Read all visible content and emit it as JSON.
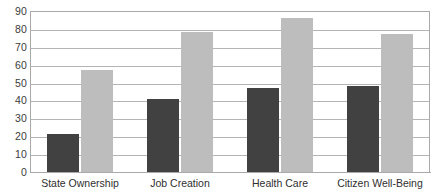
{
  "chart_data": {
    "type": "bar",
    "title": "",
    "subtitle": "",
    "xlabel": "",
    "ylabel": "",
    "ylim": [
      0,
      90
    ],
    "ytick_step": 10,
    "yticks": [
      0,
      10,
      20,
      30,
      40,
      50,
      60,
      70,
      80,
      90
    ],
    "ytick_labels": [
      "0",
      "10",
      "20",
      "30",
      "40",
      "50",
      "60",
      "70",
      "80",
      "90"
    ],
    "grid": true,
    "grid_axis": "y",
    "legend": false,
    "legend_position": "none",
    "categories": [
      "State Ownership",
      "Job Creation",
      "Health Care",
      "Citizen Well-Being"
    ],
    "series": [
      {
        "name": "series-1",
        "color": "#414141",
        "values": [
          21,
          41,
          47,
          48
        ]
      },
      {
        "name": "series-2",
        "color": "#bdbdbd",
        "values": [
          57,
          78,
          86,
          77
        ]
      }
    ]
  },
  "colors": {
    "background": "#ffffff",
    "gridline": "#b4b4b4",
    "axis": "#a9a9a9",
    "tick_text": "#3b3b3b",
    "category_text": "#2f2f2f",
    "series_dark": "#414141",
    "series_light": "#bdbdbd"
  }
}
